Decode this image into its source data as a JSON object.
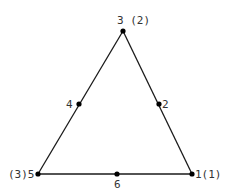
{
  "diagram": {
    "type": "triangular-element",
    "stroke_color": "#1a1a1a",
    "label_color": "#333333",
    "edges": [
      {
        "from": "1",
        "to": "3"
      },
      {
        "from": "3",
        "to": "5"
      },
      {
        "from": "5",
        "to": "1"
      }
    ],
    "nodes": [
      {
        "id": "1",
        "label": "1(1)",
        "x": 192,
        "y": 174,
        "kind": "vertex"
      },
      {
        "id": "2",
        "label": "2",
        "x": 159,
        "y": 104,
        "kind": "midside"
      },
      {
        "id": "3",
        "label": "3 (2)",
        "x": 123,
        "y": 31,
        "kind": "vertex"
      },
      {
        "id": "4",
        "label": "4",
        "x": 79,
        "y": 104,
        "kind": "midside"
      },
      {
        "id": "5",
        "label": "(3)5",
        "x": 38,
        "y": 174,
        "kind": "vertex"
      },
      {
        "id": "6",
        "label": "6",
        "x": 117,
        "y": 174,
        "kind": "midside"
      }
    ]
  }
}
